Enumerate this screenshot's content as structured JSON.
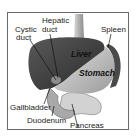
{
  "diagram": {
    "type": "anatomy",
    "labels": {
      "cystic_duct_line1": "Cystic",
      "cystic_duct_line2": "duct",
      "hepatic_duct_line1": "Hepatic",
      "hepatic_duct_line2": "duct",
      "spleen": "Spleen",
      "gallbladder": "Gallbladder",
      "duodenum": "Duodenum",
      "pancreas": "Pancreas"
    },
    "organs": {
      "liver": "Liver",
      "stomach": "Stomach"
    },
    "colors": {
      "liver": "#3c3c3c",
      "stomach": "#c8c8c8",
      "spleen": "#555555",
      "pancreas": "#d4d4d4",
      "duodenum": "#a8a8a8",
      "esophagus": "#b0b0b0",
      "frame": "#6a6a6a"
    }
  }
}
